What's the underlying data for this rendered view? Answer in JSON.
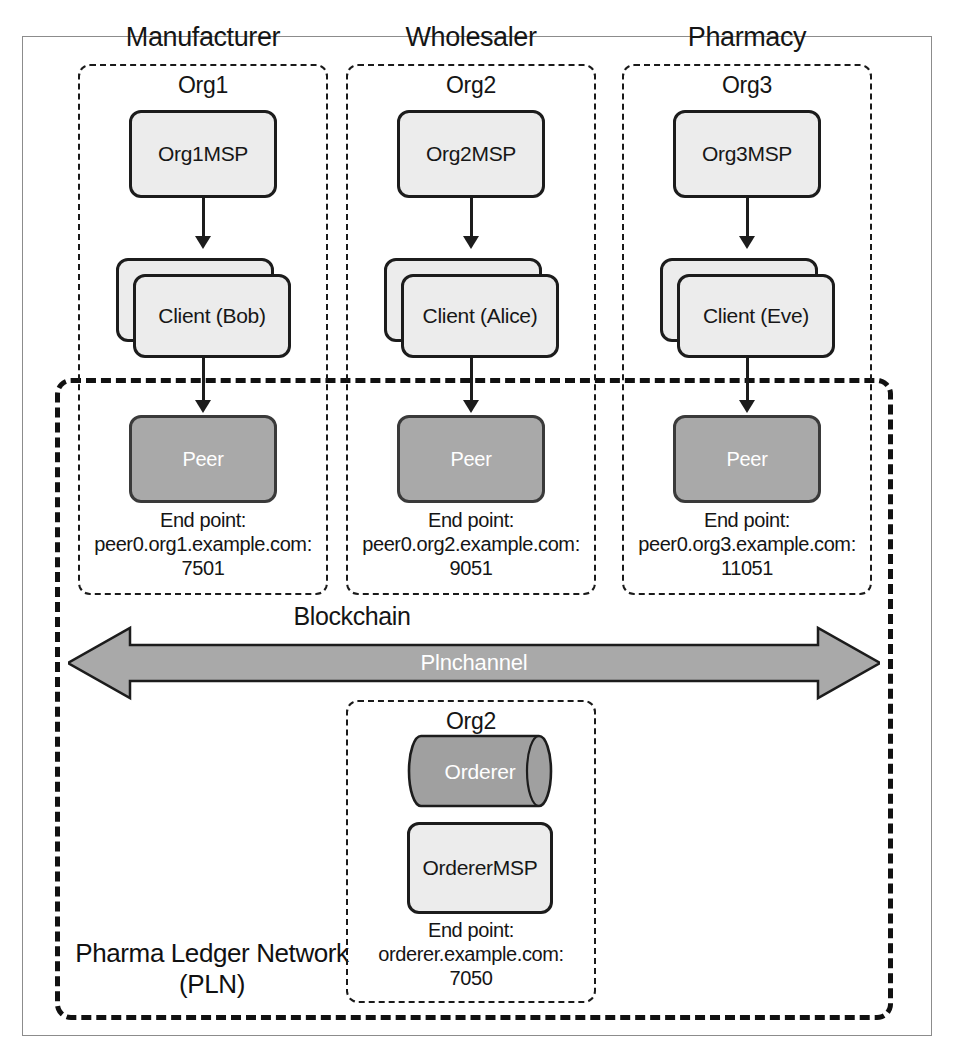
{
  "diagram": {
    "title": "Pharma Ledger Network",
    "network_label_line1": "Pharma Ledger Network",
    "network_label_line2": "(PLN)",
    "blockchain_label": "Blockchain",
    "channel_label": "Plnchannel",
    "endpoint_prefix": "End point:"
  },
  "colors": {
    "node_fill": "#ececec",
    "peer_fill": "#a9a9a9",
    "orderer_fill": "#a0a0a0",
    "channel_fill": "#a9a9a9",
    "stroke": "#1c1c1c",
    "frame": "#8c8c8c"
  },
  "columns": [
    {
      "header": "Manufacturer",
      "org": "Org1",
      "msp": "Org1MSP",
      "client": "Client (Bob)",
      "peer": "Peer",
      "endpoint_label": "End point:",
      "endpoint_host": "peer0.org1.example.com:",
      "endpoint_port": "7501"
    },
    {
      "header": "Wholesaler",
      "org": "Org2",
      "msp": "Org2MSP",
      "client": "Client (Alice)",
      "peer": "Peer",
      "endpoint_label": "End point:",
      "endpoint_host": "peer0.org2.example.com:",
      "endpoint_port": "9051"
    },
    {
      "header": "Pharmacy",
      "org": "Org3",
      "msp": "Org3MSP",
      "client": "Client (Eve)",
      "peer": "Peer",
      "endpoint_label": "End point:",
      "endpoint_host": "peer0.org3.example.com:",
      "endpoint_port": "11051"
    }
  ],
  "orderer": {
    "org": "Org2",
    "node": "Orderer",
    "msp": "OrdererMSP",
    "endpoint_label": "End point:",
    "endpoint_host": "orderer.example.com:",
    "endpoint_port": "7050"
  }
}
